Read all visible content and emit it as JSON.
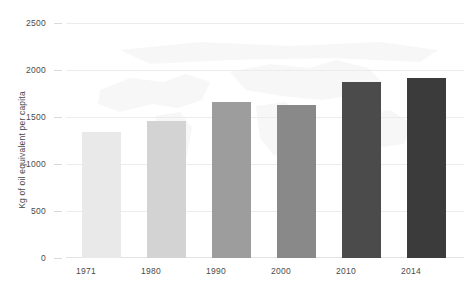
{
  "chart_data": {
    "type": "bar",
    "title": "",
    "subtitle": "",
    "xlabel": "",
    "ylabel": "Kg of oil equivalent per capita",
    "categories": [
      "1971",
      "1980",
      "1990",
      "2000",
      "2010",
      "2014"
    ],
    "values": [
      1340,
      1460,
      1660,
      1630,
      1870,
      1920
    ],
    "ylim": [
      0,
      2500
    ],
    "ytick_labels": [
      "0",
      "500",
      "1000",
      "1500",
      "2000",
      "2500"
    ],
    "ytick_values": [
      0,
      500,
      1000,
      1500,
      2000,
      2500
    ],
    "grid": true,
    "legend": "none",
    "bar_colors": [
      "#e9e9e9",
      "#d3d3d3",
      "#9d9d9d",
      "#898989",
      "#4b4b4b",
      "#3b3b3b"
    ],
    "gridline_color": "#ececec",
    "background": "#ffffff",
    "watermark": "world-map"
  }
}
